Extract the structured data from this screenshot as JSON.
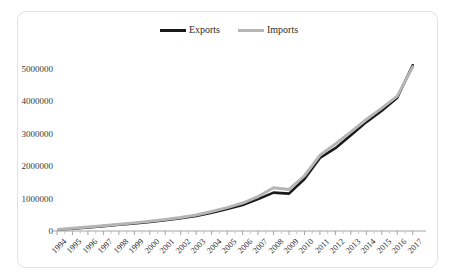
{
  "chart_data": {
    "type": "line",
    "title": "",
    "subtitle": "",
    "xlabel": "",
    "ylabel": "",
    "grid": false,
    "legend_position": "top-center",
    "categories": [
      "1994",
      "1995",
      "1996",
      "1997",
      "1998",
      "1999",
      "2000",
      "2001",
      "2002",
      "2003",
      "2004",
      "2005",
      "2006",
      "2007",
      "2008",
      "2009",
      "2010",
      "2011",
      "2012",
      "2013",
      "2014",
      "2015",
      "2016",
      "2017"
    ],
    "x": [
      "1994",
      "1995",
      "1996",
      "1997",
      "1998",
      "1999",
      "2000",
      "2001",
      "2002",
      "2003",
      "2004",
      "2005",
      "2006",
      "2007",
      "2008",
      "2009",
      "2010",
      "2011",
      "2012",
      "2013",
      "2014",
      "2015",
      "2016",
      "2017"
    ],
    "xlim": [
      "1994",
      "2017"
    ],
    "ylim": [
      0,
      5500000
    ],
    "ytick_labels": [
      "0",
      "1000000",
      "2000000",
      "3000000",
      "4000000",
      "5000000"
    ],
    "ytick_values": [
      0,
      1000000,
      2000000,
      3000000,
      4000000,
      5000000
    ],
    "series": [
      {
        "name": "Exports",
        "color": "#1a1a1a",
        "values": [
          40000,
          70000,
          110000,
          150000,
          190000,
          230000,
          280000,
          330000,
          390000,
          460000,
          560000,
          680000,
          800000,
          980000,
          1180000,
          1150000,
          1600000,
          2250000,
          2550000,
          2950000,
          3350000,
          3700000,
          4100000,
          5100000
        ]
      },
      {
        "name": "Imports",
        "color": "#b5b5b5",
        "values": [
          50000,
          85000,
          125000,
          165000,
          205000,
          250000,
          300000,
          355000,
          415000,
          490000,
          600000,
          720000,
          860000,
          1060000,
          1330000,
          1280000,
          1700000,
          2330000,
          2680000,
          3050000,
          3430000,
          3780000,
          4150000,
          5050000
        ]
      }
    ],
    "legend": [
      {
        "label": "Exports",
        "color": "#1a1a1a"
      },
      {
        "label": "Imports",
        "color": "#b5b5b5"
      }
    ]
  },
  "legend": {
    "exports_label": "Exports",
    "imports_label": "Imports"
  },
  "colors": {
    "exports": "#1a1a1a",
    "imports": "#b5b5b5",
    "axis": "#9a9a9a",
    "frame": "#e2e2e2",
    "text": "#2e2e2e",
    "background": "#ffffff"
  }
}
